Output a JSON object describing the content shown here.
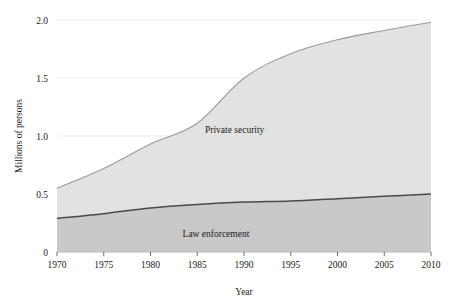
{
  "chart_data": {
    "type": "area",
    "stacked": true,
    "title": "",
    "xlabel": "Year",
    "ylabel": "Millions of persons",
    "xlim": [
      1970,
      2010
    ],
    "ylim": [
      0,
      2.0
    ],
    "xticks": [
      1970,
      1975,
      1980,
      1985,
      1990,
      1995,
      2000,
      2005,
      2010
    ],
    "xtick_labels": [
      "1970",
      "1975",
      "1980",
      "1985",
      "1990",
      "1995",
      "2000",
      "2005",
      "2010"
    ],
    "yticks": [
      0,
      0.5,
      1.0,
      1.5,
      2.0
    ],
    "ytick_labels": [
      "0",
      "0.5",
      "1.0",
      "1.5",
      "2.0"
    ],
    "grid": true,
    "legend_position": "inline-annotation",
    "x": [
      1970,
      1975,
      1980,
      1985,
      1990,
      1995,
      2000,
      2005,
      2010
    ],
    "series": [
      {
        "name": "Law enforcement",
        "color": "#c9c9c9",
        "line_color": "#4a4a4a",
        "label_x": 1987,
        "label_y": 0.16,
        "values": [
          0.29,
          0.33,
          0.38,
          0.41,
          0.43,
          0.44,
          0.46,
          0.48,
          0.5
        ]
      },
      {
        "name": "Private security",
        "color": "#e2e2e2",
        "line_color": "#9a9a9a",
        "label_x": 1989,
        "label_y": 1.06,
        "values": [
          0.26,
          0.39,
          0.55,
          0.7,
          1.07,
          1.27,
          1.37,
          1.43,
          1.48
        ]
      }
    ],
    "totals": [
      0.55,
      0.72,
      0.93,
      1.11,
      1.5,
      1.71,
      1.83,
      1.91,
      1.98
    ],
    "annotations": [
      {
        "text": "Private security",
        "x": 1989,
        "y": 1.06
      },
      {
        "text": "Law enforcement",
        "x": 1987,
        "y": 0.16
      }
    ]
  }
}
